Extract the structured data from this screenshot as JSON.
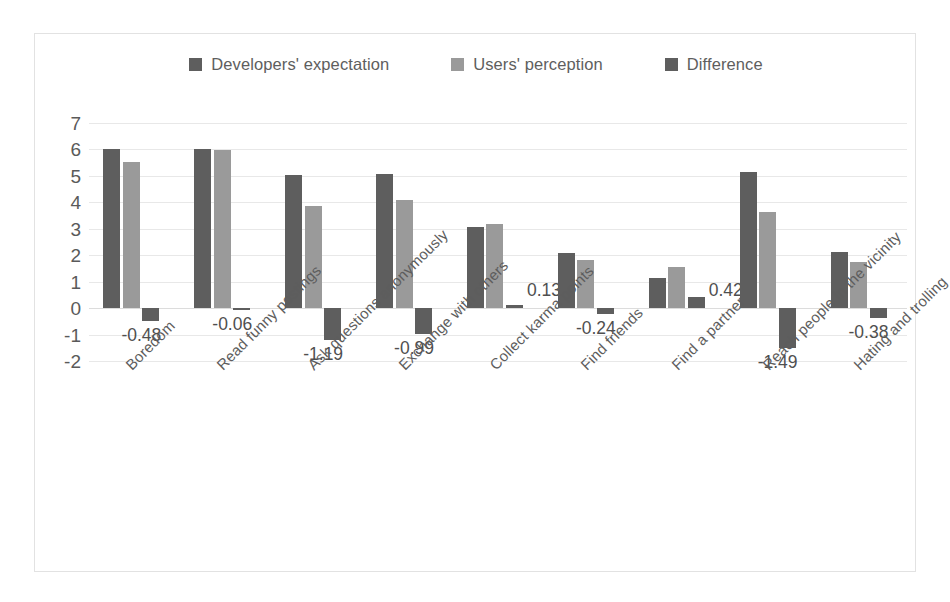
{
  "chart_data": {
    "type": "bar",
    "title": "",
    "xlabel": "",
    "ylabel": "",
    "ylim": [
      -2,
      7
    ],
    "yticks": [
      7,
      6,
      5,
      4,
      3,
      2,
      1,
      0,
      -1,
      -2
    ],
    "grid": true,
    "legend_position": "top-center",
    "categories": [
      "Boredom",
      "Read funny postings",
      "Ask questions anonymously",
      "Exchange with others",
      "Collect karma points",
      "Find friends",
      "Find a partner",
      "Reach people in the vicinity",
      "Hating and trolling"
    ],
    "series": [
      {
        "name": "Developers' expectation",
        "color": "#5e5e5e",
        "values": [
          6.0,
          6.0,
          5.05,
          5.07,
          3.05,
          2.07,
          1.14,
          5.13,
          2.14
        ]
      },
      {
        "name": "Users' perception",
        "color": "#9a9a9a",
        "values": [
          5.52,
          5.97,
          3.86,
          4.08,
          3.18,
          1.83,
          1.56,
          3.64,
          1.76
        ]
      },
      {
        "name": "Difference",
        "color": "#5e5e5e",
        "values": [
          -0.48,
          -0.06,
          -1.19,
          -0.99,
          0.13,
          -0.24,
          0.42,
          -1.49,
          -0.38
        ]
      }
    ],
    "data_labels": [
      "-0.48",
      "-0.06",
      "-1.19",
      "-0.99",
      "0.13",
      "-0.24",
      "0.42",
      "-1.49",
      "-0.38"
    ]
  }
}
